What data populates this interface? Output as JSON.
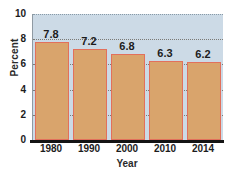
{
  "chart_data": {
    "type": "bar",
    "title": "",
    "categories": [
      "1980",
      "1990",
      "2000",
      "2010",
      "2014"
    ],
    "values": [
      7.8,
      7.2,
      6.8,
      6.3,
      6.2
    ],
    "data_labels": [
      "7.8",
      "7.2",
      "6.8",
      "6.3",
      "6.2"
    ],
    "xlabel": "Year",
    "ylabel": "Percent",
    "ylim": [
      0,
      10
    ],
    "ytick_values": [
      0,
      2,
      4,
      6,
      8,
      10
    ],
    "ytick_labels": [
      "0",
      "2",
      "4",
      "6",
      "8",
      "10"
    ],
    "grid": "horizontal-dotted",
    "legend": "none",
    "colors": {
      "bar_fill": "#d9a46c",
      "bar_border": "#e2705c",
      "plot_background": "#ccdae6",
      "page_background": "#ffffff",
      "gridline": "#6d6a63",
      "axis_line": "#141414",
      "text": "#1c1c1c"
    }
  }
}
